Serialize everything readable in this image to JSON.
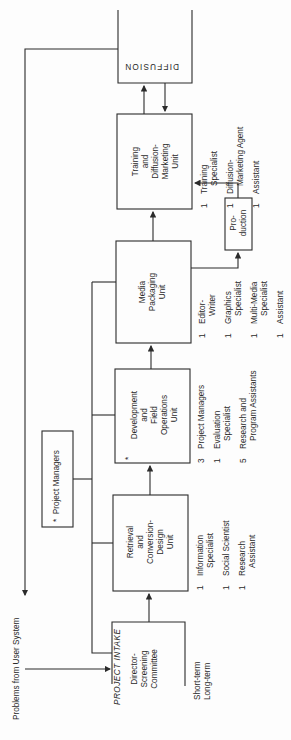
{
  "diagram": {
    "orientation": "rotated-90-ccw",
    "input_label": "Problems from User System",
    "project_intake": {
      "title": "PROJECT INTAKE",
      "lines": [
        "Director-",
        "Screening",
        "Committee"
      ],
      "terms": [
        "Short-term",
        "Long-term"
      ]
    },
    "project_managers": {
      "marker": "*",
      "label": "Project Managers"
    },
    "units": [
      {
        "id": "retrieval",
        "lines": [
          "Retrieval",
          "and",
          "Conversion-",
          "Design",
          "Unit"
        ],
        "staff": [
          {
            "count": "1",
            "role": [
              "Information",
              "Specialist"
            ]
          },
          {
            "count": "1",
            "role": [
              "Social Scientist"
            ]
          },
          {
            "count": "1",
            "role": [
              "Research",
              "Assistant"
            ]
          }
        ]
      },
      {
        "id": "development",
        "marker": "*",
        "lines": [
          "Development",
          "and",
          "Field",
          "Operations",
          "Unit"
        ],
        "staff": [
          {
            "count": "3",
            "role": [
              "Project Managers"
            ]
          },
          {
            "count": "1",
            "role": [
              "Evaluation",
              "Specialist"
            ]
          },
          {
            "count": "5",
            "role": [
              "Research and",
              "Program Assistants"
            ]
          }
        ]
      },
      {
        "id": "media",
        "lines": [
          "Media",
          "Packaging",
          "Unit"
        ],
        "staff": [
          {
            "count": "1",
            "role": [
              "Editor-",
              "Writer"
            ]
          },
          {
            "count": "1",
            "role": [
              "Graphics",
              "Specialist"
            ]
          },
          {
            "count": "1",
            "role": [
              "Multi-Media",
              "Specialist"
            ]
          },
          {
            "count": "1",
            "role": [
              "Assistant"
            ]
          }
        ]
      },
      {
        "id": "training",
        "lines": [
          "Training",
          "and",
          "Diffusion-",
          "Marketing",
          "Unit"
        ],
        "staff": [
          {
            "count": "1",
            "role": [
              "Training",
              "Specialist"
            ]
          },
          {
            "count": "1",
            "role": [
              "Diffusion-",
              "Marketing Agent"
            ]
          },
          {
            "count": "1",
            "role": [
              "Assistant"
            ]
          }
        ]
      }
    ],
    "production": {
      "lines": [
        "Pro-",
        "duction"
      ]
    },
    "diffusion": {
      "label": "DIFFUSION"
    },
    "colors": {
      "line": "#2b2b2b",
      "text": "#2a2a2a",
      "background": "#fdfdfd"
    }
  }
}
